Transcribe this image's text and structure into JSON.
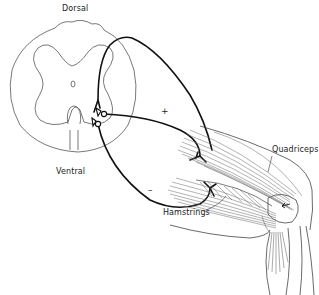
{
  "diagram": {
    "labels": {
      "dorsal": "Dorsal",
      "ventral": "Ventral",
      "quadriceps": "Quadriceps",
      "hamstrings": "Hamstrings"
    },
    "signs": {
      "excitatory": "+",
      "inhibitory": "–"
    },
    "colors": {
      "nerve": "#111111",
      "outline": "#555555",
      "muscle_fiber": "#666666",
      "background": "#ffffff"
    }
  }
}
